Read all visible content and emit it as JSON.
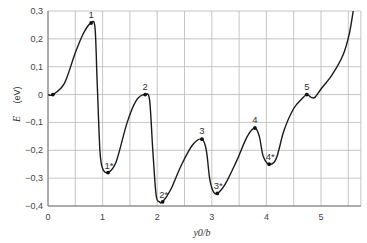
{
  "chart_data": {
    "type": "line",
    "title": "",
    "xlabel": "y0/b",
    "ylabel": "E",
    "ylabel_unit": "(eV)",
    "xlim": [
      0,
      5.73
    ],
    "ylim": [
      -0.4,
      0.3
    ],
    "grid": true,
    "x_ticks": [
      0,
      1,
      2,
      3,
      4,
      5
    ],
    "x_tick_labels": [
      "0",
      "1",
      "2",
      "3",
      "4",
      "5"
    ],
    "x_grid": [
      0,
      0.5,
      1,
      1.5,
      2,
      2.5,
      3,
      3.5,
      4,
      4.5,
      5,
      5.5
    ],
    "y_ticks": [
      0.3,
      0.2,
      0.1,
      0,
      -0.1,
      -0.2,
      -0.3,
      -0.4
    ],
    "y_tick_labels": [
      "0,3",
      "0,2",
      "0,1",
      "0",
      "-0,1",
      "-0,2",
      "-0,3",
      "-0,4"
    ],
    "series": [
      {
        "name": "E(y0/b)",
        "x": [
          0.0,
          0.09,
          0.3,
          0.5,
          0.65,
          0.79,
          0.86,
          0.9,
          0.95,
          1.0,
          1.1,
          1.25,
          1.45,
          1.62,
          1.78,
          1.86,
          1.92,
          1.98,
          2.04,
          2.1,
          2.25,
          2.45,
          2.65,
          2.82,
          2.9,
          2.96,
          3.02,
          3.1,
          3.25,
          3.45,
          3.65,
          3.79,
          3.87,
          3.94,
          4.05,
          4.18,
          4.32,
          4.5,
          4.65,
          4.74,
          4.82,
          4.89,
          5.0,
          5.2,
          5.4,
          5.52,
          5.59
        ],
        "values": [
          0.0,
          0.0,
          0.04,
          0.15,
          0.22,
          0.257,
          0.24,
          0.05,
          -0.2,
          -0.265,
          -0.28,
          -0.24,
          -0.1,
          -0.02,
          0.0,
          -0.02,
          -0.2,
          -0.36,
          -0.385,
          -0.385,
          -0.34,
          -0.25,
          -0.18,
          -0.16,
          -0.2,
          -0.3,
          -0.345,
          -0.355,
          -0.32,
          -0.24,
          -0.15,
          -0.12,
          -0.15,
          -0.22,
          -0.25,
          -0.23,
          -0.13,
          -0.05,
          -0.015,
          0.0,
          -0.01,
          -0.01,
          0.02,
          0.07,
          0.14,
          0.22,
          0.3
        ]
      }
    ],
    "marked_points": [
      {
        "label": "",
        "x": 0.09,
        "y": 0.0
      },
      {
        "label": "1",
        "x": 0.79,
        "y": 0.257
      },
      {
        "label": "1*",
        "x": 1.1,
        "y": -0.28
      },
      {
        "label": "2",
        "x": 1.78,
        "y": 0.0
      },
      {
        "label": "2*",
        "x": 2.1,
        "y": -0.385
      },
      {
        "label": "3",
        "x": 2.82,
        "y": -0.16
      },
      {
        "label": "3*",
        "x": 3.1,
        "y": -0.355
      },
      {
        "label": "4",
        "x": 3.79,
        "y": -0.12
      },
      {
        "label": "4*",
        "x": 4.05,
        "y": -0.25
      },
      {
        "label": "5",
        "x": 4.74,
        "y": 0.0
      }
    ]
  }
}
